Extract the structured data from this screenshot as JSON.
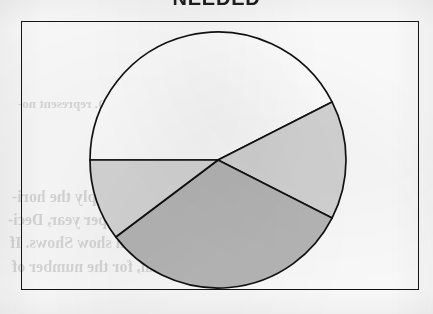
{
  "page": {
    "title": "NEEDED",
    "title_truncated": true,
    "background_color": "#fdfdfd",
    "media": "scanned-book-page"
  },
  "frame": {
    "border_color": "#141414",
    "x": 21,
    "y": 21,
    "width": 398,
    "height": 269
  },
  "bleed_through": {
    "description": "faint mirrored text showing through from the reverse side of the page",
    "lines": [
      {
        "text": "a, B. 5. D. represent no-",
        "x": 18,
        "y": 96,
        "size": 13
      },
      {
        "text": "lies sep. 6, Supply the hori-",
        "x": 12,
        "y": 188,
        "size": 16
      },
      {
        "text": "separation per year, Deci-",
        "x": 8,
        "y": 211,
        "size": 16
      },
      {
        "text": "thi, which show Shows. If",
        "x": 10,
        "y": 234,
        "size": 16
      },
      {
        "text": "topical, for the number of",
        "x": 12,
        "y": 258,
        "size": 16
      }
    ]
  },
  "chart_data": {
    "type": "pie",
    "title": "NEEDED",
    "xlabel": "",
    "ylabel": "",
    "legend": "none",
    "grid": false,
    "labels_shown": false,
    "center": {
      "x": 218,
      "y": 160
    },
    "radius": 128,
    "start_angle_deg": 180,
    "direction": "clockwise",
    "categories": [
      "Slice 1",
      "Slice 2",
      "Slice 3",
      "Slice 4"
    ],
    "values": [
      57.5,
      15.0,
      32.2,
      10.3
    ],
    "slices": [
      {
        "name": "Slice 1",
        "fill": "#ffffff",
        "shade": "white",
        "start_deg": 180,
        "end_deg": 333,
        "sweep_deg": 153,
        "percent": 42.5
      },
      {
        "name": "Slice 2",
        "fill": "#d6d6d6",
        "shade": "light-gray",
        "start_deg": 333,
        "end_deg": 27,
        "sweep_deg": 54,
        "percent": 15.0
      },
      {
        "name": "Slice 3",
        "fill": "#b8b8b8",
        "shade": "medium-gray",
        "start_deg": 27,
        "end_deg": 143,
        "sweep_deg": 116,
        "percent": 32.2
      },
      {
        "name": "Slice 4",
        "fill": "#d9d9d9",
        "shade": "light-gray",
        "start_deg": 143,
        "end_deg": 180,
        "sweep_deg": 37,
        "percent": 10.3
      }
    ],
    "stroke_color": "#111111"
  }
}
